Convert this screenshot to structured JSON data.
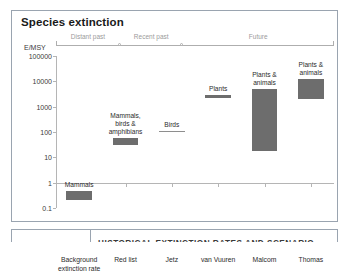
{
  "chart_title": "Species extinction",
  "unit_label": "E/MSY",
  "caption": {
    "text": "HISTORICAL EXTINCTION RATES AND SCENARIO"
  },
  "timeline": {
    "segments": [
      {
        "label": "Distant past",
        "start_pct": 0,
        "end_pct": 23
      },
      {
        "label": "Recent past",
        "start_pct": 23,
        "end_pct": 45.5
      },
      {
        "label": "Future",
        "start_pct": 45.5,
        "end_pct": 100
      }
    ]
  },
  "chart_data": {
    "type": "bar",
    "title": "Species extinction",
    "xlabel": "",
    "ylabel": "E/MSY",
    "yscale": "log",
    "ylim": [
      0.1,
      100000
    ],
    "ytick_labels": [
      "100000",
      "10000",
      "1000",
      "100",
      "10",
      "1",
      "0.1"
    ],
    "ytick_values": [
      100000,
      10000,
      1000,
      100,
      10,
      1,
      0.1
    ],
    "grid": false,
    "legend": "none",
    "categories": [
      "Background\nextinction rate",
      "Red list",
      "Jetz",
      "van Vuuren",
      "Malcom",
      "Thomas"
    ],
    "bars": [
      {
        "category": "Background extinction rate",
        "label": "Mammals",
        "low": 0.2,
        "high": 0.45,
        "style": "bar"
      },
      {
        "category": "Red list",
        "label": "Mammals,\nbirds &\namphibians",
        "low": 30,
        "high": 60,
        "style": "bar"
      },
      {
        "category": "Jetz",
        "label": "Birds",
        "low": 110,
        "high": 110,
        "style": "line"
      },
      {
        "category": "van Vuuren",
        "label": "Plants",
        "low": 2200,
        "high": 2800,
        "style": "bar"
      },
      {
        "category": "Malcom",
        "label": "Plants &\nanimals",
        "low": 17,
        "high": 5200,
        "style": "bar"
      },
      {
        "category": "Thomas",
        "label": "Plants &\nanimals",
        "low": 2000,
        "high": 12000,
        "style": "bar"
      }
    ]
  },
  "colors": {
    "bar_fill": "#6d6d6d",
    "axis": "#b5b5b5",
    "timeline": "#aeaeae",
    "timeline_text": "#9b9b9b",
    "frame": "#9aa4b0"
  }
}
